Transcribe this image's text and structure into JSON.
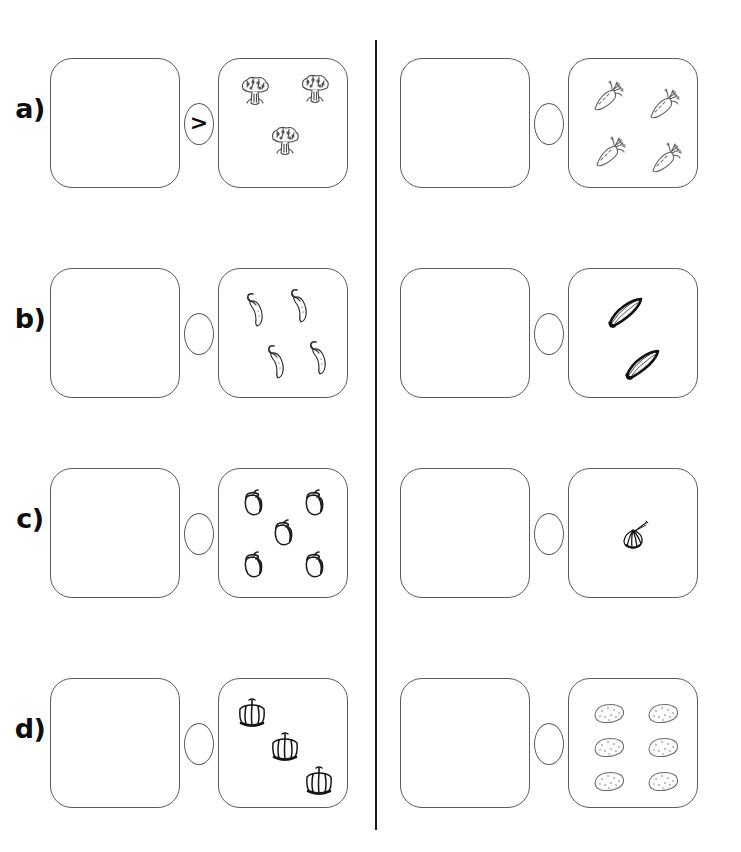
{
  "worksheet": {
    "divider_color": "#1a1a1a",
    "outline_color": "#5a5a5a",
    "ink_color": "#0d0d0d"
  },
  "rows": [
    {
      "label": "a)",
      "exercises": [
        {
          "answer_box_value": "",
          "comparison_symbol": ">",
          "item_name": "broccoli",
          "item_count": 3,
          "positions": [
            [
              36,
              34
            ],
            [
              96,
              32
            ],
            [
              66,
              84
            ]
          ]
        },
        {
          "answer_box_value": "",
          "comparison_symbol": "",
          "item_name": "carrot",
          "item_count": 4,
          "positions": [
            [
              38,
              38
            ],
            [
              94,
              46
            ],
            [
              40,
              94
            ],
            [
              96,
              100
            ]
          ]
        }
      ]
    },
    {
      "label": "b)",
      "exercises": [
        {
          "answer_box_value": "",
          "comparison_symbol": "",
          "item_name": "chili-pepper",
          "item_count": 4,
          "positions": [
            [
              37,
              42
            ],
            [
              81,
              38
            ],
            [
              58,
              94
            ],
            [
              100,
              90
            ]
          ]
        },
        {
          "answer_box_value": "",
          "comparison_symbol": "",
          "item_name": "eggplant-long",
          "item_count": 2,
          "positions": [
            [
              57,
              44
            ],
            [
              74,
              96
            ]
          ]
        }
      ]
    },
    {
      "label": "c)",
      "exercises": [
        {
          "answer_box_value": "",
          "comparison_symbol": "",
          "item_name": "eggplant-round",
          "item_count": 5,
          "positions": [
            [
              35,
              35
            ],
            [
              96,
              35
            ],
            [
              65,
              65
            ],
            [
              35,
              97
            ],
            [
              96,
              97
            ]
          ]
        },
        {
          "answer_box_value": "",
          "comparison_symbol": "",
          "item_name": "garlic",
          "item_count": 1,
          "positions": [
            [
              66,
              66
            ]
          ]
        }
      ]
    },
    {
      "label": "d)",
      "exercises": [
        {
          "answer_box_value": "",
          "comparison_symbol": "",
          "item_name": "bell-pepper",
          "item_count": 3,
          "positions": [
            [
              33,
              34
            ],
            [
              66,
              68
            ],
            [
              100,
              102
            ]
          ]
        },
        {
          "answer_box_value": "",
          "comparison_symbol": "",
          "item_name": "potato",
          "item_count": 6,
          "positions": [
            [
              40,
              34
            ],
            [
              94,
              34
            ],
            [
              40,
              68
            ],
            [
              94,
              68
            ],
            [
              40,
              102
            ],
            [
              94,
              102
            ]
          ]
        }
      ]
    }
  ]
}
